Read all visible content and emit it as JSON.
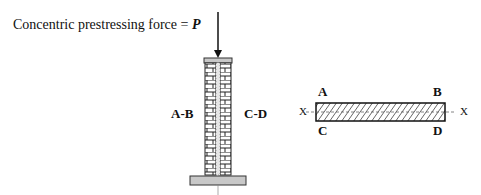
{
  "caption": {
    "text": "Concentric prestressing force = ",
    "symbol": "P"
  },
  "elevation": {
    "left_label": "A-B",
    "right_label": "C-D"
  },
  "section": {
    "corner_labels": {
      "top_left": "A",
      "top_right": "B",
      "bottom_left": "C",
      "bottom_right": "D"
    },
    "axis_left": "X",
    "axis_right": "X"
  },
  "colors": {
    "plate": "#c8c8c8",
    "line": "#1a1a1a",
    "grout": "#e6e6e6"
  }
}
